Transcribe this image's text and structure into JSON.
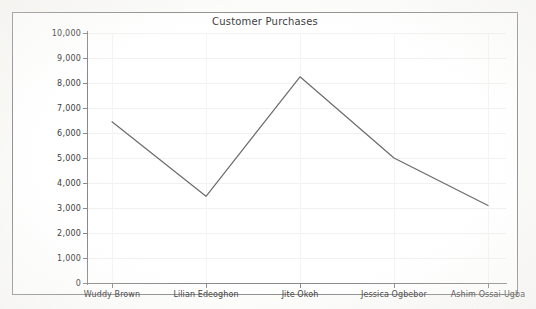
{
  "chart_data": {
    "type": "line",
    "title": "Customer Purchases",
    "xlabel": "",
    "ylabel": "",
    "categories": [
      "Wuddy Brown",
      "Lilian Edeoghon",
      "Jite Okoh",
      "Jessica Ogbebor",
      "Ashim Ossai-Ugba"
    ],
    "values": [
      6450,
      3470,
      8250,
      5000,
      3100
    ],
    "series": [
      {
        "name": "Customer Purchases",
        "values": [
          6450,
          3470,
          8250,
          5000,
          3100
        ]
      }
    ],
    "ylim": [
      0,
      10000
    ],
    "ytick_step": 1000,
    "ytick_labels": [
      "10,000",
      "9,000",
      "8,000",
      "7,000",
      "6,000",
      "5,000",
      "4,000",
      "3,000",
      "2,000",
      "1,000",
      "0"
    ],
    "ytick_values": [
      10000,
      9000,
      8000,
      7000,
      6000,
      5000,
      4000,
      3000,
      2000,
      1000,
      0
    ],
    "grid": true,
    "legend": false,
    "legend_position": "none",
    "line_color": "#6b6b6b",
    "axis_color": "#8a8a8a",
    "grid_color": "#f1f1ef",
    "text_color": "#3b3b3b",
    "frame_color": "#8d8d8d",
    "background_color": "#ffffff"
  }
}
